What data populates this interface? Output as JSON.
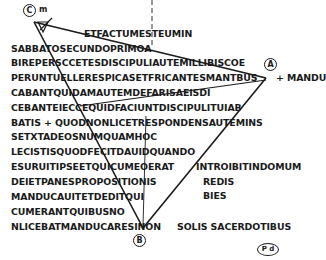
{
  "figure": {
    "markers": {
      "A": "A",
      "B": "B",
      "C": "C"
    },
    "corner_note": "m",
    "stamp": "P d",
    "lines": [
      "ETFACTUMESTEUMIN",
      "SABBATOSECUNDOPRIMOA",
      "BIREPERSCCETESDISCIPULIAUTEMILLIBISCOE",
      "PERUNTUELLERESPICASETFRICANTESMANTBUS",
      "CABANTQUIDAMAUTEMDEFARISAEISDI",
      "CEBANTEIECCEQUIDFACIUNTDISCIPULITUIAB",
      "BATIS + QUODNONLICETRESPONDENSAUTEMINS",
      "SETXTADEOSNUMQUAMHOC",
      "LECISTISQUODFECITDAUIDQUANDO",
      "ESURUITIPSEETQUICUMEOERAT",
      "DEIETPANESPROPOSITIONIS",
      "MANDUCAUITETDEDITQUI",
      "CUMERANTQUIBUSNO",
      "NLICEBATMANDUCARESINON"
    ],
    "right_fragments": {
      "line4_end": "+ MANDU",
      "line10_end": "INTROIBITINDOMUM",
      "line11_end": "REDIS",
      "line12_end": "BIES",
      "line14_end": "SOLIS SACERDOTIBUS"
    }
  },
  "colors": {
    "ink": "#1a1a1a",
    "background": "#ffffff"
  }
}
